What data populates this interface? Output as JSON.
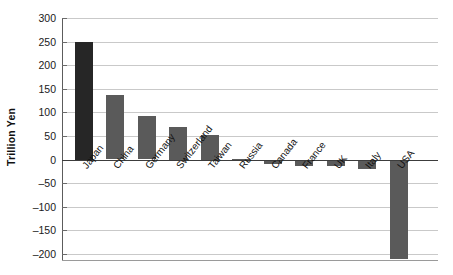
{
  "chart_data": {
    "type": "bar",
    "title": "",
    "xlabel": "",
    "ylabel": "Trillion Yen",
    "categories": [
      "Japan",
      "China",
      "Germany",
      "Switzerland",
      "Taiwan",
      "Russia",
      "Canada",
      "France",
      "UK",
      "Italy",
      "USA"
    ],
    "values": [
      250,
      137,
      92,
      70,
      52,
      2,
      -10,
      -14,
      -14,
      -19,
      -210
    ],
    "series": [
      {
        "name": "Net international investment position",
        "values": [
          250,
          137,
          92,
          70,
          52,
          2,
          -10,
          -14,
          -14,
          -19,
          -210
        ]
      }
    ],
    "ylim": [
      -215,
      300
    ],
    "yticks": [
      300,
      250,
      200,
      150,
      100,
      50,
      0,
      -50,
      -100,
      -150,
      -200
    ],
    "ytick_labels": [
      "300",
      "250",
      "200",
      "150",
      "100",
      "50",
      "0",
      "–50",
      "–100",
      "–150",
      "–200"
    ],
    "grid": true,
    "legend": "none",
    "colors": {
      "bar_default": "#5a5a5a",
      "bar_highlight": "#262626",
      "gridline": "#c9c9c9",
      "axis": "#5c5c5c",
      "zero_line": "#3c3c3c",
      "text": "#111111",
      "background": "#ffffff"
    },
    "highlight_category": "Japan"
  }
}
